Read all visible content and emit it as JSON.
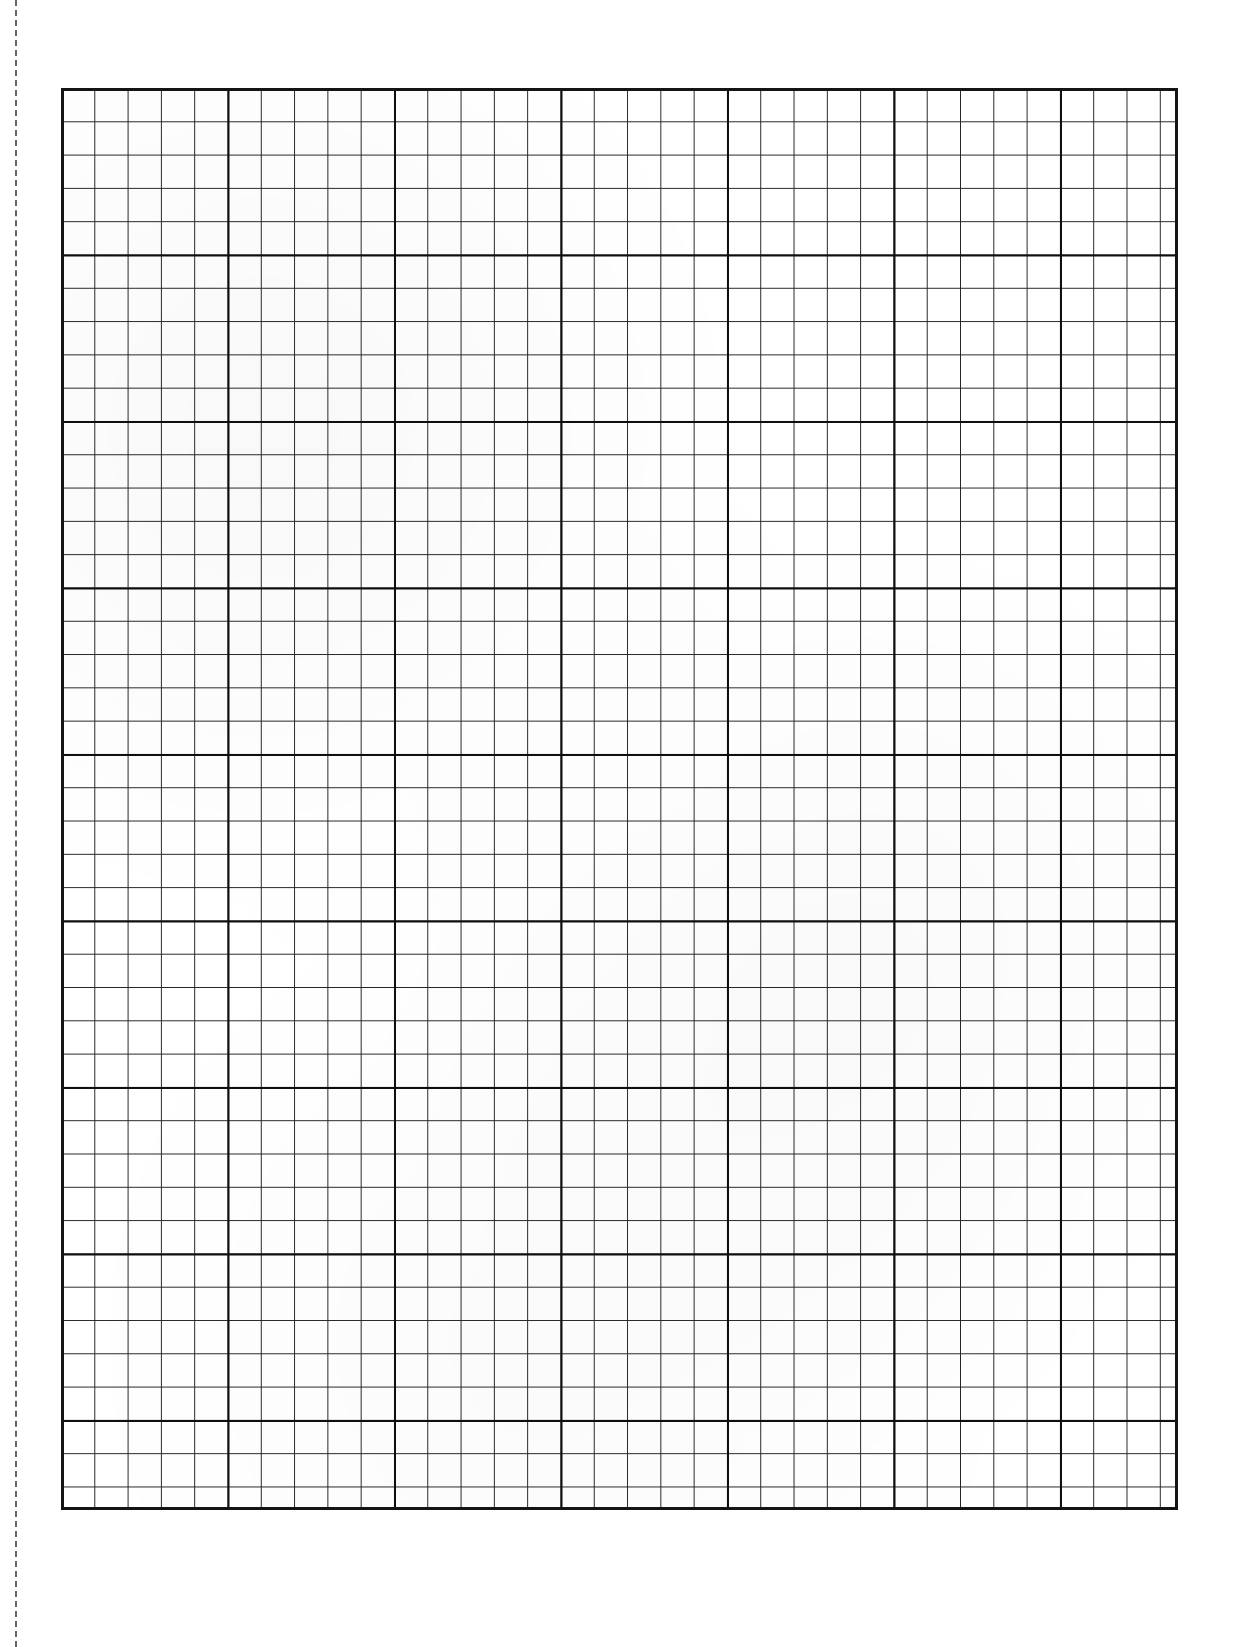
{
  "document": {
    "kind": "graph-paper-sheet",
    "title": "Blank Graph Paper Sheet",
    "page_width": 1238,
    "page_height": 1647,
    "background_color": "#ffffff",
    "ink_color": "#141414"
  },
  "margin_line": {
    "name": "left-margin-dashed-line",
    "orientation": "vertical",
    "style": "dashed",
    "color": "#4a4a4a",
    "x": 15,
    "top": 0,
    "height": 1647,
    "thickness": 2
  },
  "grid": {
    "name": "graph-grid",
    "left": 61,
    "top": 88,
    "width": 1117,
    "height": 1422,
    "cell_size": 33.3,
    "columns": 34,
    "rows": 43,
    "minor_line_color": "#262626",
    "minor_line_width": 1,
    "major_line_color": "#0f0f0f",
    "major_line_width": 2,
    "major_every": 5,
    "border_color": "#141414",
    "border_width": 3
  },
  "chart_data": {
    "type": "table",
    "title": "Blank Graph Paper Sheet",
    "xlabel": "",
    "ylabel": "",
    "categories": [],
    "values": [],
    "series": [],
    "annotations": [],
    "legend_position": "none",
    "grid": true
  }
}
